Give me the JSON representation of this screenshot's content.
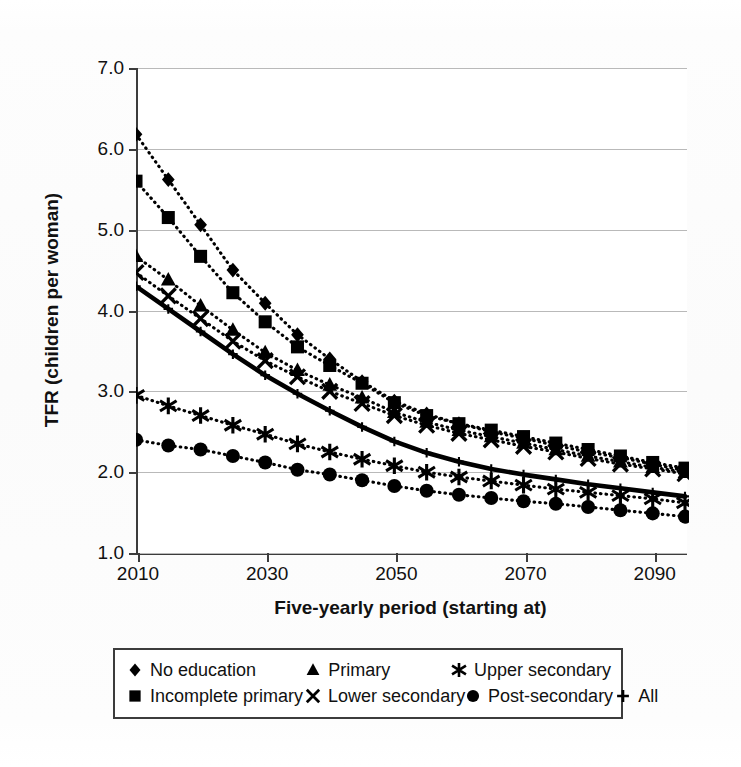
{
  "figure": {
    "background_color": "#ffffff",
    "ink_color": "#111111",
    "grid_color": "#b9b9b9",
    "axis_color": "#3c3c3c"
  },
  "axes": {
    "y_title": "TFR (children per woman)",
    "x_title": "Five-yearly period (starting at)",
    "y_ticks": [
      "1.0",
      "2.0",
      "3.0",
      "4.0",
      "5.0",
      "6.0",
      "7.0"
    ],
    "x_ticks": [
      "2010",
      "2030",
      "2050",
      "2070",
      "2090"
    ]
  },
  "legend": {
    "rows": [
      [
        {
          "marker": "diamond-marker",
          "label": "No education"
        },
        {
          "marker": "triangle-marker",
          "label": "Primary"
        },
        {
          "marker": "asterisk-marker",
          "label": "Upper secondary"
        }
      ],
      [
        {
          "marker": "square-marker",
          "label": "Incomplete primary"
        },
        {
          "marker": "cross-marker",
          "label": "Lower secondary"
        },
        {
          "marker": "circle-marker",
          "label": "Post-secondary"
        },
        {
          "marker": "plus-marker",
          "label": "All"
        }
      ]
    ]
  },
  "chart_data": {
    "type": "line",
    "title": "",
    "subtitle": "",
    "xlabel": "Five-yearly period (starting at)",
    "ylabel": "TFR (children per woman)",
    "xlim": [
      2010,
      2095
    ],
    "ylim": [
      1.0,
      7.0
    ],
    "ytick_step": 1.0,
    "xtick_labels": [
      2010,
      2030,
      2050,
      2070,
      2090
    ],
    "grid": "horizontal",
    "legend_position": "below-plot",
    "x": [
      2010,
      2015,
      2020,
      2025,
      2030,
      2035,
      2040,
      2045,
      2050,
      2055,
      2060,
      2065,
      2070,
      2075,
      2080,
      2085,
      2090,
      2095
    ],
    "series": [
      {
        "name": "No education",
        "marker": "diamond",
        "linestyle": "dotted",
        "values": [
          6.18,
          5.62,
          5.06,
          4.5,
          4.09,
          3.7,
          3.4,
          3.12,
          2.88,
          2.72,
          2.6,
          2.5,
          2.42,
          2.33,
          2.25,
          2.18,
          2.1,
          2.02
        ]
      },
      {
        "name": "Incomplete primary",
        "marker": "square",
        "linestyle": "dotted",
        "values": [
          5.6,
          5.15,
          4.67,
          4.22,
          3.86,
          3.55,
          3.32,
          3.1,
          2.86,
          2.7,
          2.6,
          2.52,
          2.44,
          2.36,
          2.28,
          2.2,
          2.12,
          2.05
        ]
      },
      {
        "name": "Primary",
        "marker": "triangle",
        "linestyle": "dotted",
        "values": [
          4.67,
          4.38,
          4.06,
          3.76,
          3.48,
          3.26,
          3.08,
          2.92,
          2.74,
          2.62,
          2.52,
          2.44,
          2.36,
          2.28,
          2.2,
          2.13,
          2.06,
          2.0
        ]
      },
      {
        "name": "Lower secondary",
        "marker": "cross",
        "linestyle": "dotted",
        "values": [
          4.47,
          4.18,
          3.9,
          3.62,
          3.38,
          3.18,
          3.0,
          2.85,
          2.7,
          2.58,
          2.48,
          2.4,
          2.32,
          2.25,
          2.17,
          2.1,
          2.04,
          1.98
        ]
      },
      {
        "name": "Upper secondary",
        "marker": "asterisk",
        "linestyle": "dotted",
        "values": [
          2.95,
          2.82,
          2.7,
          2.58,
          2.47,
          2.35,
          2.25,
          2.16,
          2.08,
          2.0,
          1.94,
          1.89,
          1.84,
          1.79,
          1.75,
          1.71,
          1.67,
          1.62
        ]
      },
      {
        "name": "Post-secondary",
        "marker": "circle",
        "linestyle": "dotted",
        "values": [
          2.4,
          2.33,
          2.28,
          2.2,
          2.12,
          2.03,
          1.97,
          1.9,
          1.83,
          1.77,
          1.72,
          1.68,
          1.64,
          1.61,
          1.57,
          1.53,
          1.49,
          1.45
        ]
      },
      {
        "name": "All",
        "marker": "plus",
        "linestyle": "solid-bold",
        "values": [
          4.3,
          4.02,
          3.74,
          3.46,
          3.2,
          2.97,
          2.76,
          2.56,
          2.38,
          2.24,
          2.13,
          2.04,
          1.97,
          1.91,
          1.85,
          1.8,
          1.75,
          1.7
        ]
      }
    ]
  }
}
